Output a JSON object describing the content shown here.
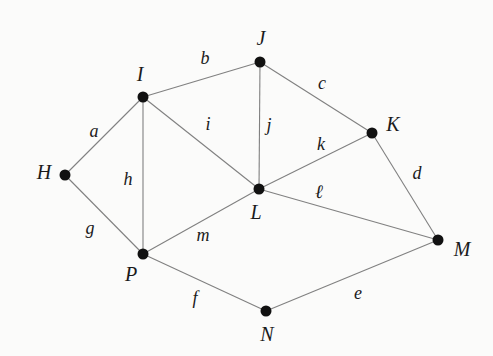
{
  "diagram": {
    "background_color": "#fbfbfa",
    "edge_color": "#808080",
    "vertex_color": "#111111",
    "width": 493,
    "height": 356,
    "vertices": [
      {
        "id": "H",
        "label": "H",
        "x": 65,
        "y": 175,
        "label_x": 44,
        "label_y": 172,
        "r": 5.5
      },
      {
        "id": "I",
        "label": "I",
        "x": 143,
        "y": 97,
        "label_x": 140,
        "label_y": 74,
        "r": 5.5
      },
      {
        "id": "J",
        "label": "J",
        "x": 260,
        "y": 62,
        "label_x": 261,
        "label_y": 38,
        "r": 5.5
      },
      {
        "id": "K",
        "label": "K",
        "x": 372,
        "y": 133,
        "label_x": 393,
        "label_y": 124,
        "r": 5.5
      },
      {
        "id": "L",
        "label": "L",
        "x": 259,
        "y": 189,
        "label_x": 256,
        "label_y": 212,
        "r": 5.5
      },
      {
        "id": "M",
        "label": "M",
        "x": 438,
        "y": 240,
        "label_x": 462,
        "label_y": 249,
        "r": 5.5
      },
      {
        "id": "N",
        "label": "N",
        "x": 266,
        "y": 311,
        "label_x": 267,
        "label_y": 334,
        "r": 5.5
      },
      {
        "id": "P",
        "label": "P",
        "x": 143,
        "y": 254,
        "label_x": 131,
        "label_y": 274,
        "r": 5.5
      }
    ],
    "edges": [
      {
        "id": "a",
        "label": "a",
        "from": "H",
        "to": "I",
        "label_x": 94,
        "label_y": 131
      },
      {
        "id": "b",
        "label": "b",
        "from": "I",
        "to": "J",
        "label_x": 205,
        "label_y": 58
      },
      {
        "id": "c",
        "label": "c",
        "from": "J",
        "to": "K",
        "label_x": 322,
        "label_y": 83
      },
      {
        "id": "d",
        "label": "d",
        "from": "K",
        "to": "M",
        "label_x": 417,
        "label_y": 173
      },
      {
        "id": "e",
        "label": "e",
        "from": "N",
        "to": "M",
        "label_x": 358,
        "label_y": 293
      },
      {
        "id": "f",
        "label": "f",
        "from": "P",
        "to": "N",
        "label_x": 195,
        "label_y": 298
      },
      {
        "id": "g",
        "label": "g",
        "from": "H",
        "to": "P",
        "label_x": 90,
        "label_y": 228
      },
      {
        "id": "h",
        "label": "h",
        "from": "I",
        "to": "P",
        "label_x": 128,
        "label_y": 179
      },
      {
        "id": "i",
        "label": "i",
        "from": "I",
        "to": "L",
        "label_x": 208,
        "label_y": 124
      },
      {
        "id": "j",
        "label": "j",
        "from": "J",
        "to": "L",
        "label_x": 269,
        "label_y": 125
      },
      {
        "id": "k",
        "label": "k",
        "from": "L",
        "to": "K",
        "label_x": 321,
        "label_y": 144
      },
      {
        "id": "l",
        "label": "ℓ",
        "from": "L",
        "to": "M",
        "label_x": 319,
        "label_y": 191,
        "script": true
      },
      {
        "id": "m",
        "label": "m",
        "from": "P",
        "to": "L",
        "label_x": 203,
        "label_y": 235
      }
    ]
  }
}
